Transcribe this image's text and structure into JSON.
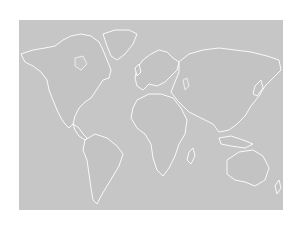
{
  "map": {
    "type": "world-political-outline",
    "background_color": "#ffffff",
    "ocean_color": "#c6c6c6",
    "land_color": "#c3c3c3",
    "outline_color": "#ffffff",
    "regions": [
      "North America",
      "Greenland",
      "South America",
      "Europe",
      "Africa",
      "Asia",
      "Australia"
    ]
  }
}
